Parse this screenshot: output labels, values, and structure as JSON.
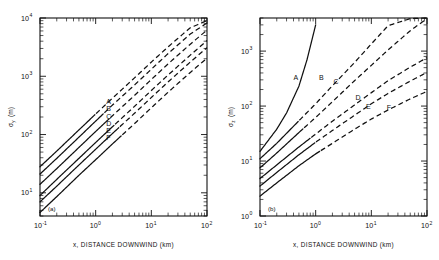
{
  "figure": {
    "panels": [
      {
        "id": "a",
        "panel_label": "(a)",
        "ylabel_main": "σ",
        "ylabel_sub": "y",
        "ylabel_units": "(m)",
        "xlabel": "x, DISTANCE DOWNWIND (km)",
        "x_ticklabels": [
          "10",
          "10",
          "10",
          "10"
        ],
        "x_exponents": [
          "-1",
          "0",
          "1",
          "2"
        ],
        "y_ticklabels": [
          "10",
          "10",
          "10",
          "10"
        ],
        "y_exponents": [
          "1",
          "2",
          "3",
          "4"
        ],
        "curve_labels": [
          "A",
          "B",
          "C",
          "D",
          "E",
          "F"
        ]
      },
      {
        "id": "b",
        "panel_label": "(b)",
        "ylabel_main": "σ",
        "ylabel_sub": "z",
        "ylabel_units": "(m)",
        "xlabel": "x, DISTANCE DOWNWIND (km)",
        "x_ticklabels": [
          "10",
          "10",
          "10",
          "10"
        ],
        "x_exponents": [
          "-1",
          "0",
          "1",
          "2"
        ],
        "y_ticklabels": [
          "10",
          "10",
          "10",
          "10"
        ],
        "y_exponents": [
          "0",
          "1",
          "2",
          "3"
        ],
        "curve_labels": [
          "A",
          "B",
          "C",
          "D",
          "E",
          "F"
        ]
      }
    ]
  },
  "chart_data": [
    {
      "type": "line",
      "title": "",
      "panel": "(a)",
      "xlabel": "x, DISTANCE DOWNWIND (km)",
      "ylabel": "σy (m)",
      "xscale": "log",
      "yscale": "log",
      "xlim": [
        0.1,
        100
      ],
      "ylim": [
        4,
        10000
      ],
      "grid": false,
      "legend": "inline-curve-labels",
      "series": [
        {
          "name": "A",
          "x": [
            0.1,
            0.2,
            0.5,
            1,
            2,
            5,
            10,
            20,
            50,
            100
          ],
          "y": [
            28,
            52,
            120,
            225,
            420,
            940,
            1750,
            3200,
            6800,
            9000
          ],
          "solid_until_x": 1.0
        },
        {
          "name": "B",
          "x": [
            0.1,
            0.2,
            0.5,
            1,
            2,
            5,
            10,
            20,
            50,
            100
          ],
          "y": [
            21,
            39,
            90,
            170,
            320,
            710,
            1320,
            2450,
            5300,
            8200
          ],
          "solid_until_x": 1.4
        },
        {
          "name": "C",
          "x": [
            0.1,
            0.2,
            0.5,
            1,
            2,
            5,
            10,
            20,
            50,
            100
          ],
          "y": [
            14,
            26,
            60,
            113,
            210,
            470,
            880,
            1630,
            3550,
            6200
          ],
          "solid_until_x": 1.8
        },
        {
          "name": "D",
          "x": [
            0.1,
            0.2,
            0.5,
            1,
            2,
            5,
            10,
            20,
            50,
            100
          ],
          "y": [
            9.0,
            17,
            39,
            73,
            136,
            305,
            570,
            1050,
            2300,
            4100
          ],
          "solid_until_x": 2.2
        },
        {
          "name": "E",
          "x": [
            0.1,
            0.2,
            0.5,
            1,
            2,
            5,
            10,
            20,
            50,
            100
          ],
          "y": [
            7.0,
            13,
            30,
            56,
            104,
            232,
            432,
            800,
            1750,
            3100
          ],
          "solid_until_x": 2.6
        },
        {
          "name": "F",
          "x": [
            0.1,
            0.2,
            0.5,
            1,
            2,
            5,
            10,
            20,
            50,
            100
          ],
          "y": [
            4.6,
            8.6,
            20,
            37,
            69,
            154,
            288,
            532,
            1160,
            2050
          ],
          "solid_until_x": 3.0
        }
      ]
    },
    {
      "type": "line",
      "title": "",
      "panel": "(b)",
      "xlabel": "x, DISTANCE DOWNWIND (km)",
      "ylabel": "σz (m)",
      "xscale": "log",
      "yscale": "log",
      "xlim": [
        0.1,
        100
      ],
      "ylim": [
        1,
        4000
      ],
      "grid": false,
      "legend": "inline-curve-labels",
      "series": [
        {
          "name": "A",
          "x": [
            0.1,
            0.2,
            0.3,
            0.5,
            0.7,
            1.0
          ],
          "y": [
            15,
            38,
            75,
            230,
            700,
            3000
          ],
          "style": "solid"
        },
        {
          "name": "B",
          "x": [
            0.1,
            0.2,
            0.5,
            1,
            2,
            5,
            10,
            20,
            50,
            100
          ],
          "y": [
            11,
            21,
            54,
            110,
            235,
            620,
            1350,
            2900,
            3900,
            4000
          ],
          "solid_until_x": 0.5
        },
        {
          "name": "C",
          "x": [
            0.1,
            0.2,
            0.5,
            1,
            2,
            5,
            10,
            20,
            50,
            100
          ],
          "y": [
            7.5,
            14,
            33,
            62,
            120,
            290,
            550,
            1050,
            2350,
            3900
          ],
          "solid_until_x": 0.6
        },
        {
          "name": "D",
          "x": [
            0.1,
            0.2,
            0.5,
            1,
            2,
            5,
            10,
            20,
            50,
            100
          ],
          "y": [
            4.8,
            8.5,
            18,
            31,
            53,
            105,
            175,
            290,
            510,
            760
          ],
          "solid_until_x": 0.8
        },
        {
          "name": "E",
          "x": [
            0.1,
            0.2,
            0.5,
            1,
            2,
            5,
            10,
            20,
            50,
            100
          ],
          "y": [
            3.5,
            6.2,
            13,
            22,
            36,
            68,
            110,
            170,
            285,
            410
          ],
          "solid_until_x": 1.0
        },
        {
          "name": "F",
          "x": [
            0.1,
            0.2,
            0.5,
            1,
            2,
            5,
            10,
            20,
            50,
            100
          ],
          "y": [
            2.3,
            4.0,
            8.2,
            13.5,
            21,
            38,
            58,
            85,
            135,
            185
          ],
          "solid_until_x": 1.2
        }
      ]
    }
  ]
}
